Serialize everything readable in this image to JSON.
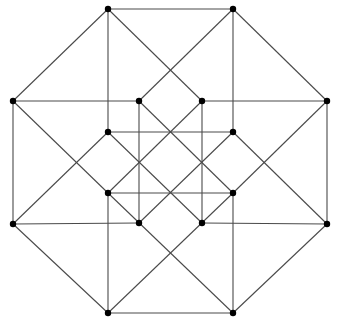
{
  "diagram": {
    "type": "graph",
    "width": 339,
    "height": 330,
    "colors": {
      "edge": "#4a4a4a",
      "vertex": "#000000",
      "background": "#ffffff"
    },
    "vertex_radius": 3.2,
    "vertices": [
      {
        "id": "A",
        "x": 108,
        "y": 9
      },
      {
        "id": "B",
        "x": 233,
        "y": 9
      },
      {
        "id": "C",
        "x": 327,
        "y": 101
      },
      {
        "id": "D",
        "x": 327,
        "y": 224
      },
      {
        "id": "E",
        "x": 233,
        "y": 313
      },
      {
        "id": "F",
        "x": 108,
        "y": 313
      },
      {
        "id": "G",
        "x": 13,
        "y": 224
      },
      {
        "id": "H",
        "x": 13,
        "y": 101
      },
      {
        "id": "I",
        "x": 139,
        "y": 101
      },
      {
        "id": "J",
        "x": 202,
        "y": 101
      },
      {
        "id": "K",
        "x": 233,
        "y": 132
      },
      {
        "id": "L",
        "x": 233,
        "y": 193
      },
      {
        "id": "M",
        "x": 202,
        "y": 223
      },
      {
        "id": "N",
        "x": 139,
        "y": 223
      },
      {
        "id": "O",
        "x": 108,
        "y": 193
      },
      {
        "id": "P",
        "x": 108,
        "y": 132
      }
    ],
    "edges": [
      [
        "A",
        "B"
      ],
      [
        "B",
        "C"
      ],
      [
        "C",
        "D"
      ],
      [
        "D",
        "E"
      ],
      [
        "E",
        "F"
      ],
      [
        "F",
        "G"
      ],
      [
        "G",
        "H"
      ],
      [
        "H",
        "A"
      ],
      [
        "A",
        "P"
      ],
      [
        "B",
        "K"
      ],
      [
        "C",
        "J"
      ],
      [
        "D",
        "M"
      ],
      [
        "E",
        "L"
      ],
      [
        "F",
        "O"
      ],
      [
        "G",
        "N"
      ],
      [
        "H",
        "I"
      ],
      [
        "A",
        "J"
      ],
      [
        "B",
        "I"
      ],
      [
        "C",
        "L"
      ],
      [
        "D",
        "K"
      ],
      [
        "E",
        "O"
      ],
      [
        "F",
        "L"
      ],
      [
        "G",
        "P"
      ],
      [
        "H",
        "O"
      ],
      [
        "I",
        "N"
      ],
      [
        "J",
        "M"
      ],
      [
        "P",
        "K"
      ],
      [
        "O",
        "L"
      ],
      [
        "I",
        "L"
      ],
      [
        "J",
        "O"
      ],
      [
        "K",
        "N"
      ],
      [
        "P",
        "M"
      ]
    ]
  }
}
